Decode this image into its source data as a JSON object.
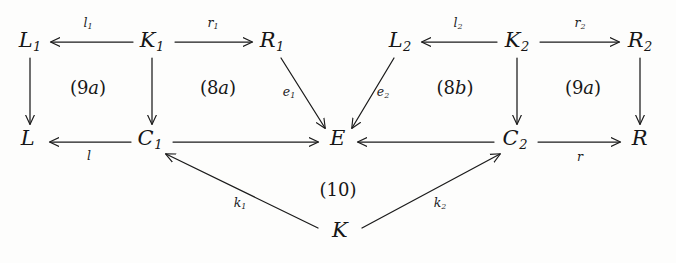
{
  "diagram": {
    "nodes": [
      {
        "id": "L1",
        "base": "L",
        "sub": "1",
        "x": 30,
        "y": 42
      },
      {
        "id": "K1",
        "base": "K",
        "sub": "1",
        "x": 152,
        "y": 42
      },
      {
        "id": "R1",
        "base": "R",
        "sub": "1",
        "x": 272,
        "y": 42
      },
      {
        "id": "L2",
        "base": "L",
        "sub": "2",
        "x": 400,
        "y": 42
      },
      {
        "id": "K2",
        "base": "K",
        "sub": "2",
        "x": 517,
        "y": 42
      },
      {
        "id": "R2",
        "base": "R",
        "sub": "2",
        "x": 640,
        "y": 42
      },
      {
        "id": "L",
        "base": "L",
        "sub": "",
        "x": 28,
        "y": 140
      },
      {
        "id": "C1",
        "base": "C",
        "sub": "1",
        "x": 150,
        "y": 140
      },
      {
        "id": "E",
        "base": "E",
        "sub": "",
        "x": 338,
        "y": 140
      },
      {
        "id": "C2",
        "base": "C",
        "sub": "2",
        "x": 515,
        "y": 140
      },
      {
        "id": "R",
        "base": "R",
        "sub": "",
        "x": 640,
        "y": 140
      },
      {
        "id": "K",
        "base": "K",
        "sub": "",
        "x": 340,
        "y": 232
      }
    ],
    "edge_labels": [
      {
        "id": "l1",
        "base": "l",
        "sub": "1",
        "x": 88,
        "y": 24
      },
      {
        "id": "r1",
        "base": "r",
        "sub": "1",
        "x": 213,
        "y": 24
      },
      {
        "id": "l2",
        "base": "l",
        "sub": "2",
        "x": 458,
        "y": 24
      },
      {
        "id": "r2",
        "base": "r",
        "sub": "2",
        "x": 580,
        "y": 24
      },
      {
        "id": "e1",
        "base": "e",
        "sub": "1",
        "x": 289,
        "y": 93
      },
      {
        "id": "e2",
        "base": "e",
        "sub": "2",
        "x": 383,
        "y": 93
      },
      {
        "id": "l",
        "base": "l",
        "sub": "",
        "x": 89,
        "y": 157
      },
      {
        "id": "r",
        "base": "r",
        "sub": "",
        "x": 580,
        "y": 158
      },
      {
        "id": "k1",
        "base": "k",
        "sub": "1",
        "x": 240,
        "y": 204
      },
      {
        "id": "k2",
        "base": "k",
        "sub": "2",
        "x": 440,
        "y": 204
      }
    ],
    "region_labels": [
      {
        "id": "9a-left",
        "open": "(",
        "num": "9",
        "letter": "a",
        "close": ")",
        "x": 88,
        "y": 88
      },
      {
        "id": "8a",
        "open": "(",
        "num": "8",
        "letter": "a",
        "close": ")",
        "x": 218,
        "y": 88
      },
      {
        "id": "8b",
        "open": "(",
        "num": "8",
        "letter": "b",
        "close": ")",
        "x": 455,
        "y": 88
      },
      {
        "id": "9a-right",
        "open": "(",
        "num": "9",
        "letter": "a",
        "close": ")",
        "x": 583,
        "y": 88
      },
      {
        "id": "10",
        "open": "(",
        "num": "10",
        "letter": "",
        "close": ")",
        "x": 338,
        "y": 190
      }
    ],
    "colors": {
      "ink": "#1b1b1b",
      "paper": "#fdfdfc"
    }
  }
}
